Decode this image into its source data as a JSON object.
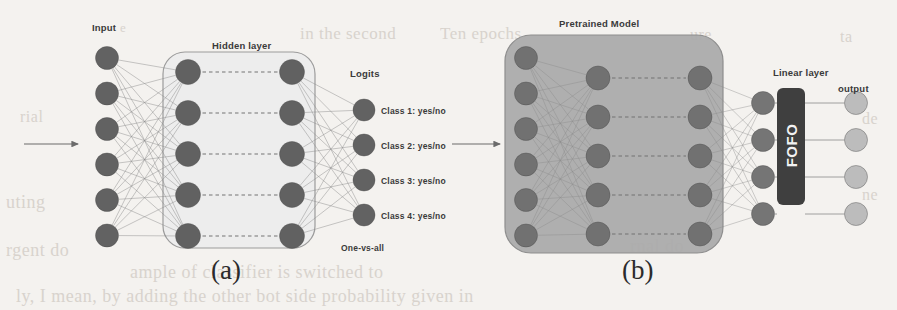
{
  "figure": {
    "width": 897,
    "height": 310,
    "background": "#f4f2ef",
    "caption_a": "(a)",
    "caption_b": "(b)"
  },
  "colors": {
    "node_dark": "#5a5a5a",
    "node_mid": "#6e6e6e",
    "node_light": "#b8b8b8",
    "box_light": "#ececec",
    "box_mid": "#ababab",
    "box_dark": "#3f3f3f",
    "edge": "#8a8a8a",
    "label_text": "#3a3a3a",
    "caption_text": "#2b2b2b"
  },
  "panel_a": {
    "caption": "(a)",
    "input_label": "Input",
    "hidden_label": "Hidden layer",
    "logits_label": "Logits",
    "one_vs_all_label": "One-vs-all",
    "input_nodes": 6,
    "hidden_left_nodes": 5,
    "hidden_right_nodes": 5,
    "logit_nodes": 4,
    "class_labels": [
      "Class 1: yes/no",
      "Class 2: yes/no",
      "Class 3: yes/no",
      "Class 4: yes/no"
    ],
    "arrow": "input-arrow"
  },
  "panel_b": {
    "caption": "(b)",
    "pretrained_label": "Pretrained Model",
    "linear_label": "Linear layer",
    "output_label": "output",
    "fofo_label": "FOFO",
    "input_nodes": 6,
    "mid_nodes": 5,
    "right_nodes": 5,
    "linear_nodes": 4,
    "output_nodes": 4,
    "arrow": "input-arrow"
  },
  "bleed_text": {
    "lines": [
      {
        "text": "in the second",
        "x": 300,
        "y": 24,
        "size": 17
      },
      {
        "text": "Ten epochs",
        "x": 440,
        "y": 24,
        "size": 17
      },
      {
        "text": "e",
        "x": 120,
        "y": 20,
        "size": 13
      },
      {
        "text": "ure",
        "x": 690,
        "y": 26,
        "size": 16
      },
      {
        "text": "ta",
        "x": 840,
        "y": 28,
        "size": 16
      },
      {
        "text": "rial",
        "x": 20,
        "y": 108,
        "size": 16
      },
      {
        "text": "de",
        "x": 862,
        "y": 110,
        "size": 16
      },
      {
        "text": "uting",
        "x": 6,
        "y": 192,
        "size": 18
      },
      {
        "text": "ne",
        "x": 862,
        "y": 186,
        "size": 16
      },
      {
        "text": "rgent do",
        "x": 6,
        "y": 240,
        "size": 18
      },
      {
        "text": "ample of classifier is switched to",
        "x": 130,
        "y": 262,
        "size": 18
      },
      {
        "text": "ly, I mean, by adding the other bot side probability given in",
        "x": 16,
        "y": 286,
        "size": 18
      },
      {
        "text": "rnal do",
        "x": 630,
        "y": 236,
        "size": 18
      }
    ]
  }
}
